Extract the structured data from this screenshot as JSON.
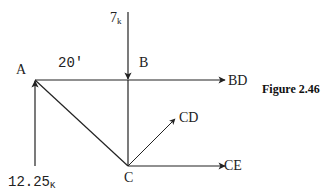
{
  "figure": {
    "caption": "Figure 2.46",
    "nodes": {
      "A": "A",
      "B": "B",
      "C": "C"
    },
    "dimension": "20'",
    "loads": {
      "applied_load": "7",
      "applied_load_unit": "k",
      "reaction": "12.25",
      "reaction_unit": "K"
    },
    "member_forces": {
      "BD": "BD",
      "CD": "CD",
      "CE": "CE"
    },
    "colors": {
      "line": "#222222",
      "background": "#ffffff"
    }
  }
}
